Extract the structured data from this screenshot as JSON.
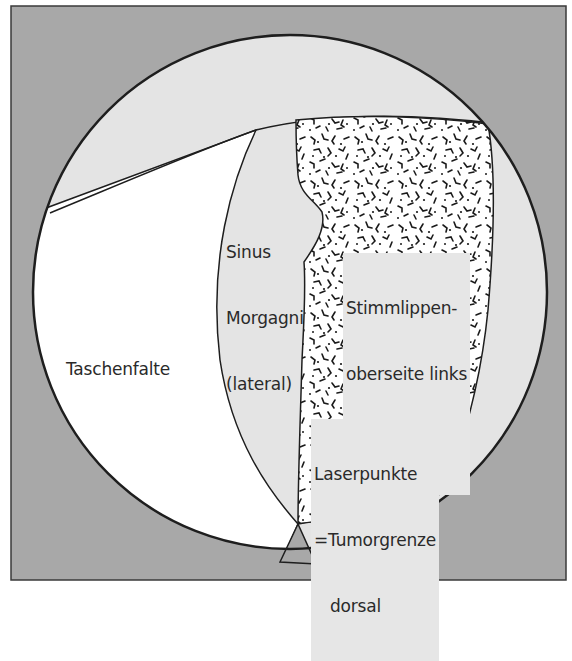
{
  "figure": {
    "colors": {
      "frame_background": "#a8a8a8",
      "frame_border": "#3a3a3a",
      "field_light_gray": "#e4e4e4",
      "taschenfalte_fill": "#ffffff",
      "tumor_fill": "#ffffff",
      "tumor_texture": "#1a1a1a",
      "outline": "#1e1e1e",
      "label_background": "#e6e6e6",
      "laser_dot": "#7a7a7a"
    },
    "labels": {
      "sinus_morgagni_line1": "Sinus",
      "sinus_morgagni_line2": "Morgagni",
      "sinus_morgagni_line3": "(lateral)",
      "taschenfalte": "Taschenfalte",
      "tumor_line1": "Stimmlippen-",
      "tumor_line2": "oberseite links",
      "tumor_line3": "mit Tumor",
      "laser_line1": "Laserpunkte",
      "laser_line2": "=Tumorgrenze",
      "laser_line3": "dorsal"
    },
    "laser_points": [
      {
        "cx": 331,
        "cy": 503,
        "r": 12
      },
      {
        "cx": 372,
        "cy": 503,
        "r": 12
      },
      {
        "cx": 409,
        "cy": 503,
        "r": 12
      }
    ]
  }
}
